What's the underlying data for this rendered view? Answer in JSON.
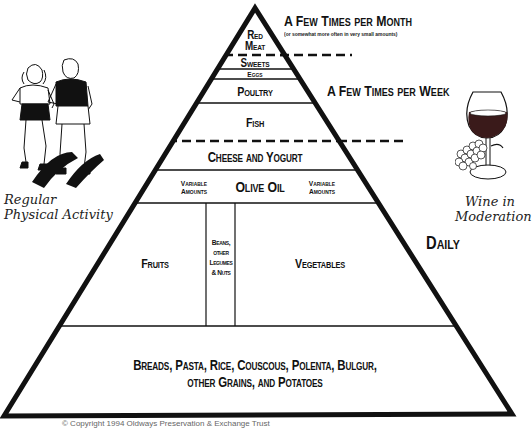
{
  "diagram": {
    "colors": {
      "line": "#111111",
      "background": "#ffffff",
      "wine": "#3a1a1a"
    },
    "tiers": [
      {
        "id": "red_meat",
        "label_line1": "Red",
        "label_line2": "Meat"
      },
      {
        "id": "sweets",
        "label": "Sweets"
      },
      {
        "id": "eggs",
        "label": "Eggs"
      },
      {
        "id": "poultry",
        "label": "Poultry"
      },
      {
        "id": "fish",
        "label": "Fish"
      },
      {
        "id": "cheese_yogurt",
        "label": "Cheese and Yogurt"
      },
      {
        "id": "olive_oil",
        "label": "Olive Oil",
        "left_note_line1": "Variable",
        "left_note_line2": "Amounts",
        "right_note_line1": "Variable",
        "right_note_line2": "Amounts"
      },
      {
        "id": "fruits",
        "label": "Fruits"
      },
      {
        "id": "beans",
        "label_line1": "Beans,",
        "label_line2": "other",
        "label_line3": "Legumes",
        "label_line4": "& Nuts"
      },
      {
        "id": "vegetables",
        "label": "Vegetables"
      },
      {
        "id": "grains",
        "label_line1": "Breads, Pasta, Rice, Couscous, Polenta, Bulgur,",
        "label_line2": "other Grains, and Potatoes"
      }
    ],
    "frequency": {
      "monthly": "A Few Times per Month",
      "monthly_note": "(or somewhat more often in very small amounts)",
      "weekly": "A Few Times per Week",
      "daily": "Daily"
    },
    "side_notes": {
      "activity_line1": "Regular",
      "activity_line2": "Physical Activity",
      "wine_line1": "Wine in",
      "wine_line2": "Moderation"
    },
    "icons": {
      "activity": "runners-illustration",
      "wine": "wine-glass-grapes-illustration"
    },
    "copyright": "© Copyright 1994 Oldways Preservation & Exchange Trust"
  }
}
